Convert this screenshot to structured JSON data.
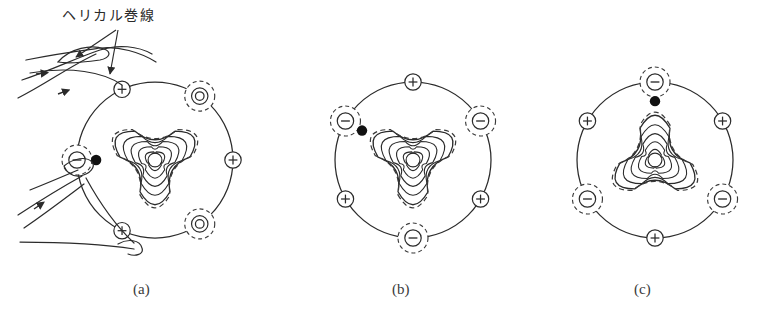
{
  "figure": {
    "annotation_label": "ヘリカル巻線",
    "panels": [
      {
        "id": "a",
        "caption": "(a)",
        "cx": 155,
        "cy": 160,
        "r": 78,
        "triangle_rotation": 180,
        "has_helical_windings": true,
        "dot_angle": 180,
        "conductors": [
          {
            "sign": "+",
            "angle": 115,
            "style": "solid",
            "glyph": "+"
          },
          {
            "sign": "-",
            "angle": 55,
            "style": "dashed",
            "glyph": "ring"
          },
          {
            "sign": "+",
            "angle": 0,
            "style": "solid",
            "glyph": "+"
          },
          {
            "sign": "-",
            "angle": -55,
            "style": "dashed",
            "glyph": "ring"
          },
          {
            "sign": "+",
            "angle": -115,
            "style": "solid",
            "glyph": "+"
          },
          {
            "sign": "-",
            "angle": 180,
            "style": "dashed",
            "glyph": "−"
          }
        ]
      },
      {
        "id": "b",
        "caption": "(b)",
        "cx": 413,
        "cy": 160,
        "r": 78,
        "triangle_rotation": 180,
        "has_helical_windings": false,
        "dot_angle": 150,
        "conductors": [
          {
            "sign": "+",
            "angle": 90,
            "style": "solid",
            "glyph": "+"
          },
          {
            "sign": "-",
            "angle": 150,
            "style": "dashed",
            "glyph": "−"
          },
          {
            "sign": "+",
            "angle": 210,
            "style": "solid",
            "glyph": "+"
          },
          {
            "sign": "-",
            "angle": 270,
            "style": "dashed",
            "glyph": "−"
          },
          {
            "sign": "+",
            "angle": 330,
            "style": "solid",
            "glyph": "+"
          },
          {
            "sign": "-",
            "angle": 30,
            "style": "dashed",
            "glyph": "−"
          }
        ]
      },
      {
        "id": "c",
        "caption": "(c)",
        "cx": 655,
        "cy": 160,
        "r": 78,
        "triangle_rotation": 0,
        "has_helical_windings": false,
        "dot_angle": 90,
        "conductors": [
          {
            "sign": "-",
            "angle": 90,
            "style": "dashed",
            "glyph": "−"
          },
          {
            "sign": "+",
            "angle": 150,
            "style": "solid",
            "glyph": "+"
          },
          {
            "sign": "-",
            "angle": 210,
            "style": "dashed",
            "glyph": "−"
          },
          {
            "sign": "+",
            "angle": 270,
            "style": "solid",
            "glyph": "+"
          },
          {
            "sign": "-",
            "angle": 330,
            "style": "dashed",
            "glyph": "−"
          },
          {
            "sign": "+",
            "angle": 30,
            "style": "solid",
            "glyph": "+"
          }
        ]
      }
    ],
    "flux_surface_scales": [
      1.0,
      0.82,
      0.64,
      0.46,
      0.28,
      0.13
    ],
    "colors": {
      "ink": "#2b2b2b",
      "dashed_ink": "#3a3a3a",
      "background": "#ffffff",
      "dot": "#111111"
    },
    "caption_positions": {
      "a_x": 133,
      "b_x": 392,
      "c_x": 634,
      "y": 281
    }
  }
}
